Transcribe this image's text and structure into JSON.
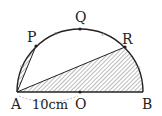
{
  "figure": {
    "type": "geometry-semicircle",
    "points": {
      "A": {
        "label": "A"
      },
      "B": {
        "label": "B"
      },
      "O": {
        "label": "O"
      },
      "P": {
        "label": "P"
      },
      "Q": {
        "label": "Q"
      },
      "R": {
        "label": "R"
      }
    },
    "measurement": {
      "segment": "AO",
      "label": "10cm"
    },
    "shaded_regions": [
      "triangle APsegment",
      "region A-R-B"
    ],
    "colors": {
      "stroke": "#222222",
      "hatch": "#555555",
      "background": "#ffffff"
    }
  }
}
